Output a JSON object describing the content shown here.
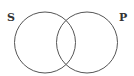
{
  "diagram": {
    "type": "venn",
    "sets": [
      {
        "id": "S",
        "label": "S"
      },
      {
        "id": "P",
        "label": "P"
      }
    ],
    "overlap": "S∩P",
    "shading": "none",
    "stroke_color": "#555555",
    "label_color": "#333333"
  }
}
